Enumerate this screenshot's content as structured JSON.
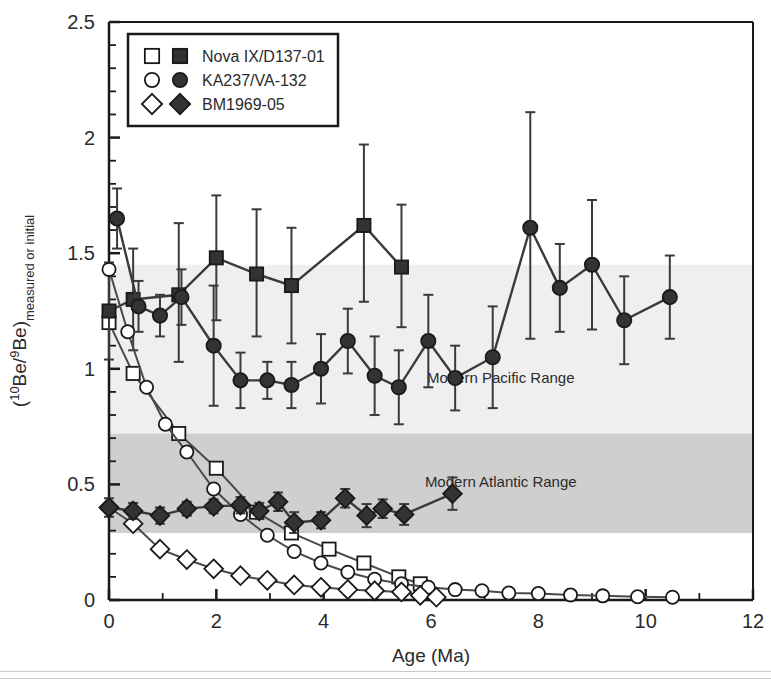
{
  "chart_data": {
    "type": "line",
    "title": "",
    "xlabel": "Age (Ma)",
    "ylabel_main": "(",
    "ylabel_sup1": "10",
    "ylabel_mid": "Be/",
    "ylabel_sup2": "9",
    "ylabel_end": "Be)",
    "ylabel_sub": "measured or initial",
    "xlim": [
      0,
      12
    ],
    "ylim": [
      0,
      2.5
    ],
    "xticks": [
      0,
      2,
      4,
      6,
      8,
      10,
      12
    ],
    "xticklabels": [
      "0",
      "2",
      "4",
      "6",
      "8",
      "10",
      "12"
    ],
    "xminor_step": 1,
    "yticks": [
      0,
      0.5,
      1,
      1.5,
      2,
      2.5
    ],
    "yticklabels": [
      "0",
      "0.5",
      "1",
      "1.5",
      "2",
      "2.5"
    ],
    "yminor_step": 0.1,
    "grid": false,
    "legend_position": "top-left",
    "marker_color": "#333333",
    "line_color": "#3a3a3a",
    "bands": [
      {
        "name": "Modern Pacific Range",
        "label": "Modern Pacific Range",
        "ymin": 0.72,
        "ymax": 1.45,
        "color": "#efefef",
        "label_x": 7.3,
        "label_y": 0.94
      },
      {
        "name": "Modern Atlantic Range",
        "label": "Modern Atlantic Range",
        "ymin": 0.29,
        "ymax": 0.72,
        "color": "#cfcfcf",
        "label_x": 7.3,
        "label_y": 0.49
      }
    ],
    "legend": [
      {
        "label": "Nova IX/D137-01",
        "open_marker": "square",
        "filled_marker": "square"
      },
      {
        "label": "KA237/VA-132",
        "open_marker": "circle",
        "filled_marker": "circle"
      },
      {
        "label": "BM1969-05",
        "open_marker": "diamond",
        "filled_marker": "diamond"
      }
    ],
    "series": [
      {
        "name": "Nova IX/D137-01 measured",
        "marker": "square",
        "fill": "open",
        "errorbars": false,
        "x": [
          0.0,
          0.45,
          1.3,
          2.0,
          2.75,
          3.4,
          4.1,
          4.75,
          5.4,
          5.8
        ],
        "y": [
          1.2,
          0.98,
          0.72,
          0.57,
          0.38,
          0.29,
          0.22,
          0.16,
          0.1,
          0.07
        ]
      },
      {
        "name": "Nova IX/D137-01 initial",
        "marker": "square",
        "fill": "filled",
        "errorbars": true,
        "x": [
          0.0,
          0.45,
          1.3,
          2.0,
          2.75,
          3.4,
          4.75,
          5.45
        ],
        "y": [
          1.25,
          1.3,
          1.32,
          1.48,
          1.41,
          1.36,
          1.62,
          1.44
        ],
        "yerr_up": [
          0.21,
          0.22,
          0.31,
          0.27,
          0.28,
          0.25,
          0.35,
          0.27
        ],
        "yerr_dn": [
          0.21,
          0.22,
          0.29,
          0.27,
          0.27,
          0.25,
          0.33,
          0.26
        ]
      },
      {
        "name": "KA237/VA-132 measured",
        "marker": "circle",
        "fill": "open",
        "errorbars": false,
        "x": [
          0.0,
          0.35,
          0.7,
          1.05,
          1.45,
          1.95,
          2.45,
          2.95,
          3.45,
          3.95,
          4.45,
          4.95,
          5.45,
          5.95,
          6.45,
          6.95,
          7.45,
          8.0,
          8.6,
          9.2,
          9.85,
          10.5
        ],
        "y": [
          1.43,
          1.16,
          0.92,
          0.76,
          0.64,
          0.48,
          0.37,
          0.28,
          0.21,
          0.16,
          0.12,
          0.09,
          0.07,
          0.055,
          0.045,
          0.04,
          0.03,
          0.028,
          0.022,
          0.018,
          0.014,
          0.012
        ]
      },
      {
        "name": "KA237/VA-132 initial",
        "marker": "circle",
        "fill": "filled",
        "errorbars": true,
        "x": [
          0.15,
          0.55,
          0.95,
          1.35,
          1.95,
          2.45,
          2.95,
          3.4,
          3.95,
          4.45,
          4.95,
          5.4,
          5.95,
          6.45,
          7.15,
          7.85,
          8.4,
          9.0,
          9.6,
          10.45
        ],
        "y": [
          1.65,
          1.27,
          1.23,
          1.31,
          1.1,
          0.95,
          0.95,
          0.93,
          1.0,
          1.12,
          0.97,
          0.92,
          1.12,
          0.96,
          1.05,
          1.61,
          1.35,
          1.45,
          1.21,
          1.31
        ],
        "yerr_up": [
          0.13,
          0.11,
          0.09,
          0.12,
          0.26,
          0.12,
          0.08,
          0.1,
          0.15,
          0.14,
          0.17,
          0.16,
          0.2,
          0.14,
          0.22,
          0.5,
          0.19,
          0.28,
          0.19,
          0.18
        ],
        "yerr_dn": [
          0.13,
          0.11,
          0.09,
          0.12,
          0.26,
          0.12,
          0.08,
          0.1,
          0.15,
          0.14,
          0.17,
          0.16,
          0.2,
          0.14,
          0.22,
          0.48,
          0.19,
          0.28,
          0.19,
          0.18
        ]
      },
      {
        "name": "BM1969-05 measured",
        "marker": "diamond",
        "fill": "open",
        "errorbars": false,
        "x": [
          0.0,
          0.45,
          0.95,
          1.45,
          1.95,
          2.45,
          2.95,
          3.45,
          3.95,
          4.45,
          4.95,
          5.45,
          5.8,
          6.1
        ],
        "y": [
          0.4,
          0.33,
          0.22,
          0.175,
          0.135,
          0.105,
          0.085,
          0.065,
          0.055,
          0.045,
          0.04,
          0.035,
          0.02,
          0.012
        ]
      },
      {
        "name": "BM1969-05 initial",
        "marker": "diamond",
        "fill": "filled",
        "errorbars": true,
        "x": [
          0.0,
          0.45,
          0.95,
          1.45,
          1.95,
          2.45,
          2.8,
          3.15,
          3.45,
          3.95,
          4.4,
          4.8,
          5.1,
          5.5,
          6.4
        ],
        "y": [
          0.4,
          0.385,
          0.365,
          0.395,
          0.405,
          0.41,
          0.385,
          0.425,
          0.335,
          0.345,
          0.44,
          0.365,
          0.395,
          0.37,
          0.46
        ],
        "yerr_up": [
          0.04,
          0.035,
          0.035,
          0.03,
          0.03,
          0.035,
          0.035,
          0.04,
          0.045,
          0.035,
          0.04,
          0.05,
          0.04,
          0.045,
          0.07
        ],
        "yerr_dn": [
          0.04,
          0.035,
          0.035,
          0.03,
          0.03,
          0.035,
          0.035,
          0.04,
          0.045,
          0.035,
          0.04,
          0.05,
          0.04,
          0.045,
          0.07
        ]
      }
    ]
  }
}
